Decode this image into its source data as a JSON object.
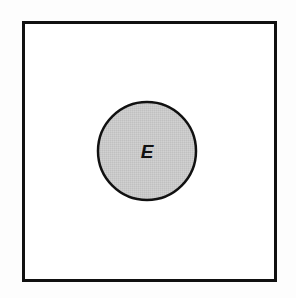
{
  "figure": {
    "name": "event-in-sample-space-venn-diagram",
    "type": "venn-diagram",
    "background_color": "#fdfdfd",
    "sample_space": {
      "shape": "rectangle",
      "label": "",
      "fill_color": "#ffffff",
      "stroke_color": "#111111",
      "stroke_width": 3,
      "x": 22,
      "y": 21,
      "width": 255,
      "height": 261
    },
    "event": {
      "shape": "circle",
      "label": "E",
      "fill_color": "#c8c8c8",
      "stroke_color": "#111111",
      "stroke_width": 2.5,
      "center_x": 147,
      "center_y": 151,
      "radius": 50,
      "label_x": 147,
      "label_y": 158
    }
  }
}
